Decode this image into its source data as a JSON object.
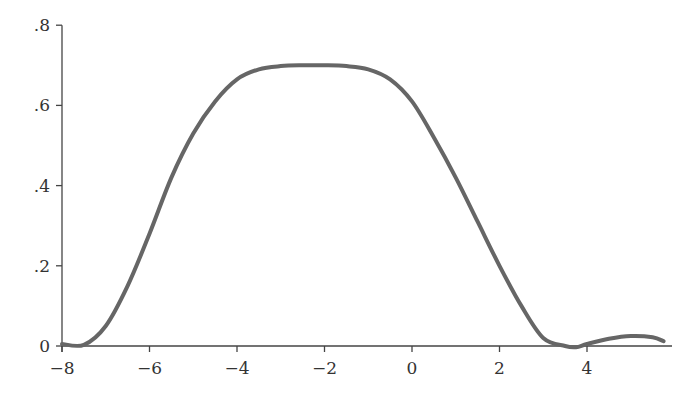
{
  "chart_data": {
    "type": "line",
    "title": "",
    "xlabel": "",
    "ylabel": "",
    "xlim": [
      -8,
      5.9
    ],
    "ylim": [
      0,
      0.8
    ],
    "grid": false,
    "legend": null,
    "x_ticks": [
      -8,
      -6,
      -4,
      -2,
      0,
      2,
      4
    ],
    "x_tick_labels": [
      "−8",
      "−6",
      "−4",
      "−2",
      "0",
      "2",
      "4"
    ],
    "y_ticks": [
      0,
      0.2,
      0.4,
      0.6,
      0.8
    ],
    "y_tick_labels": [
      "0",
      ".2",
      ".4",
      ".6",
      ".8"
    ],
    "line_color": "#666666",
    "series": [
      {
        "name": "curve",
        "x": [
          -8,
          -7.5,
          -7,
          -6.5,
          -6,
          -5.5,
          -5,
          -4.5,
          -4,
          -3.5,
          -3,
          -2.5,
          -2,
          -1.5,
          -1,
          -0.5,
          0,
          0.5,
          1,
          1.5,
          2,
          2.5,
          3,
          3.5,
          3.75,
          4,
          4.5,
          5,
          5.5,
          5.75
        ],
        "values": [
          0.005,
          0.003,
          0.05,
          0.15,
          0.28,
          0.42,
          0.53,
          0.61,
          0.665,
          0.69,
          0.698,
          0.7,
          0.7,
          0.698,
          0.69,
          0.665,
          0.61,
          0.52,
          0.42,
          0.31,
          0.2,
          0.1,
          0.02,
          0.0,
          -0.003,
          0.005,
          0.018,
          0.025,
          0.022,
          0.012
        ]
      }
    ]
  }
}
